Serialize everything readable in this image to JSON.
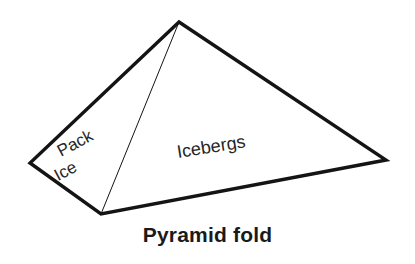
{
  "figure": {
    "type": "diagram",
    "background_color": "#ffffff",
    "stroke_color": "#141414",
    "text_color": "#262626",
    "outline_width_px": 3.4,
    "inner_edge_width_px": 1.0,
    "vertices": {
      "apex": {
        "x": 179,
        "y": 22
      },
      "left": {
        "x": 30,
        "y": 163
      },
      "bottom": {
        "x": 101,
        "y": 214
      },
      "right": {
        "x": 386,
        "y": 160
      }
    },
    "outline_path": "M 179 22 L 30 163 L 101 214 L 386 160 Z",
    "inner_edge_path": "M 179 22 L 101 214",
    "faces": [
      {
        "name": "left-face",
        "label": "Pack",
        "label_line_2": "Ice",
        "rotation_deg": -28,
        "font_size_px": 17,
        "anchor": {
          "x": 61,
          "y": 157
        },
        "line_gap_px": 20
      },
      {
        "name": "right-face",
        "label": "Icebergs",
        "rotation_deg": -9,
        "font_size_px": 18,
        "anchor": {
          "x": 178,
          "y": 158
        }
      }
    ]
  },
  "caption": {
    "text": "Pyramid fold",
    "font_size_px": 21,
    "bold": true
  }
}
